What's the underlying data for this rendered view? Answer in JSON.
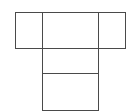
{
  "diagram": {
    "type": "box-net",
    "stroke_color": "#4a4a4a",
    "background": "#ffffff",
    "faces": [
      {
        "name": "left-face",
        "x": 15,
        "y": 12,
        "w": 28,
        "h": 37
      },
      {
        "name": "top-center-face",
        "x": 42,
        "y": 12,
        "w": 57,
        "h": 37
      },
      {
        "name": "right-face",
        "x": 98,
        "y": 12,
        "w": 28,
        "h": 37
      },
      {
        "name": "middle-face",
        "x": 42,
        "y": 48,
        "w": 57,
        "h": 26
      },
      {
        "name": "bottom-face",
        "x": 42,
        "y": 73,
        "w": 57,
        "h": 38
      }
    ]
  }
}
